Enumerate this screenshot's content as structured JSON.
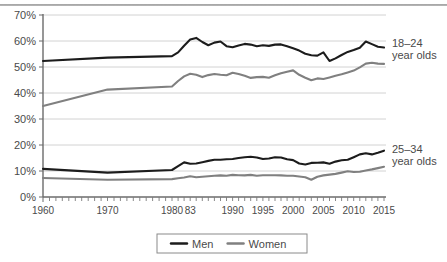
{
  "chart_data": {
    "type": "line",
    "title": "",
    "subtitle": "",
    "xlabel": "",
    "ylabel": "",
    "xlim": [
      1960,
      2015
    ],
    "ylim": [
      0,
      70
    ],
    "y_tick_labels": [
      "0%",
      "10%",
      "20%",
      "30%",
      "40%",
      "50%",
      "60%",
      "70%"
    ],
    "y_tick_values": [
      0,
      10,
      20,
      30,
      40,
      50,
      60,
      70
    ],
    "x_tick_labels": [
      "1960",
      "1970",
      "1980",
      "83",
      "1990",
      "1995",
      "2000",
      "2005",
      "2010",
      "2015"
    ],
    "x_tick_values": [
      1960,
      1970,
      1980,
      1983,
      1990,
      1995,
      2000,
      2005,
      2010,
      2015
    ],
    "grid": true,
    "legend_position": "bottom",
    "legend": [
      {
        "name": "Men",
        "color": "#1c1c1c"
      },
      {
        "name": "Women",
        "color": "#808080"
      }
    ],
    "annotations": [
      {
        "text_line1": "18–24",
        "text_line2": "year olds",
        "value": 57.5
      },
      {
        "text_line1": "25–34",
        "text_line2": "year olds",
        "value": 17.8
      }
    ],
    "series": [
      {
        "name": "Men 18-24",
        "group": "18–24 year olds",
        "sex": "Men",
        "color": "#1c1c1c",
        "x": [
          1960,
          1970,
          1980,
          1981,
          1982,
          1983,
          1984,
          1985,
          1986,
          1987,
          1988,
          1989,
          1990,
          1991,
          1992,
          1993,
          1994,
          1995,
          1996,
          1997,
          1998,
          1999,
          2000,
          2001,
          2002,
          2003,
          2004,
          2005,
          2006,
          2007,
          2008,
          2009,
          2010,
          2011,
          2012,
          2013,
          2014,
          2015
        ],
        "values": [
          52.3,
          53.6,
          54.2,
          55.6,
          58.2,
          60.6,
          61.2,
          59.6,
          58.4,
          59.4,
          59.8,
          58.0,
          57.6,
          58.3,
          58.9,
          58.6,
          58.0,
          58.4,
          58.1,
          58.6,
          58.7,
          58.0,
          57.2,
          56.3,
          55.1,
          54.5,
          54.4,
          55.6,
          52.3,
          53.3,
          54.6,
          55.8,
          56.5,
          57.4,
          59.8,
          58.8,
          57.8,
          57.5
        ]
      },
      {
        "name": "Women 18-24",
        "group": "18–24 year olds",
        "sex": "Women",
        "color": "#808080",
        "x": [
          1960,
          1970,
          1980,
          1981,
          1982,
          1983,
          1984,
          1985,
          1986,
          1987,
          1988,
          1989,
          1990,
          1991,
          1992,
          1993,
          1994,
          1995,
          1996,
          1997,
          1998,
          1999,
          2000,
          2001,
          2002,
          2003,
          2004,
          2005,
          2006,
          2007,
          2008,
          2009,
          2010,
          2011,
          2012,
          2013,
          2014,
          2015
        ],
        "values": [
          35.0,
          41.3,
          42.5,
          44.6,
          46.4,
          47.4,
          47.0,
          46.1,
          46.9,
          47.3,
          47.0,
          46.8,
          47.8,
          47.3,
          46.6,
          45.8,
          46.1,
          46.2,
          45.9,
          46.8,
          47.6,
          48.2,
          48.7,
          47.0,
          45.9,
          44.9,
          45.6,
          45.4,
          46.0,
          46.6,
          47.2,
          47.9,
          48.6,
          49.9,
          51.3,
          51.6,
          51.3,
          51.2
        ]
      },
      {
        "name": "Men 25-34",
        "group": "25–34 year olds",
        "sex": "Men",
        "color": "#1c1c1c",
        "x": [
          1960,
          1970,
          1980,
          1981,
          1982,
          1983,
          1984,
          1985,
          1986,
          1987,
          1988,
          1989,
          1990,
          1991,
          1992,
          1993,
          1994,
          1995,
          1996,
          1997,
          1998,
          1999,
          2000,
          2001,
          2002,
          2003,
          2004,
          2005,
          2006,
          2007,
          2008,
          2009,
          2010,
          2011,
          2012,
          2013,
          2014,
          2015
        ],
        "values": [
          10.8,
          9.4,
          10.4,
          11.9,
          13.3,
          12.8,
          12.9,
          13.4,
          13.9,
          14.3,
          14.3,
          14.5,
          14.6,
          15.0,
          15.3,
          15.5,
          15.2,
          14.6,
          14.8,
          15.3,
          15.2,
          14.5,
          14.2,
          12.9,
          12.5,
          13.1,
          13.2,
          13.3,
          12.8,
          13.6,
          14.1,
          14.3,
          15.3,
          16.4,
          16.8,
          16.4,
          17.0,
          17.8
        ]
      },
      {
        "name": "Women 25-34",
        "group": "25–34 year olds",
        "sex": "Women",
        "color": "#808080",
        "x": [
          1960,
          1970,
          1980,
          1981,
          1982,
          1983,
          1984,
          1985,
          1986,
          1987,
          1988,
          1989,
          1990,
          1991,
          1992,
          1993,
          1994,
          1995,
          1996,
          1997,
          1998,
          1999,
          2000,
          2001,
          2002,
          2003,
          2004,
          2005,
          2006,
          2007,
          2008,
          2009,
          2010,
          2011,
          2012,
          2013,
          2014,
          2015
        ],
        "values": [
          7.3,
          6.6,
          6.9,
          7.2,
          7.5,
          8.0,
          7.6,
          7.8,
          8.0,
          8.2,
          8.3,
          8.2,
          8.5,
          8.4,
          8.3,
          8.5,
          8.2,
          8.4,
          8.4,
          8.4,
          8.3,
          8.2,
          8.2,
          7.9,
          7.6,
          6.6,
          7.8,
          8.3,
          8.6,
          8.9,
          9.4,
          9.9,
          9.6,
          9.7,
          10.2,
          10.6,
          11.1,
          11.6
        ]
      }
    ]
  }
}
